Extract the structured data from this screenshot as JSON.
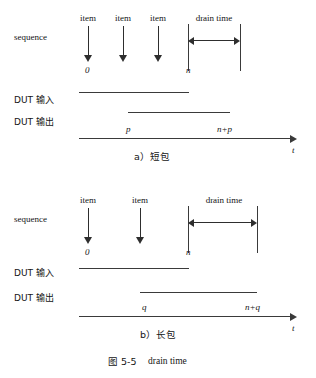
{
  "figure": {
    "caption_number": "图 5-5",
    "caption_title": "drain time"
  },
  "row_labels": {
    "sequence": "sequence",
    "dut_in": "DUT 输入",
    "dut_out": "DUT 输出"
  },
  "panel_a": {
    "subcaption": "a）短包",
    "items": [
      {
        "label": "item"
      },
      {
        "label": "item"
      },
      {
        "label": "item"
      }
    ],
    "start_marker": "0",
    "end_marker": "n",
    "drain_label": "drain time",
    "out_start_label": "p",
    "out_end_label": "n+p",
    "axis_label": "t"
  },
  "panel_b": {
    "subcaption": "b）长包",
    "items": [
      {
        "label": "item"
      },
      {
        "label": "item"
      }
    ],
    "start_marker": "0",
    "end_marker": "n",
    "drain_label": "drain time",
    "out_start_label": "q",
    "out_end_label": "n+q",
    "axis_label": "t"
  }
}
